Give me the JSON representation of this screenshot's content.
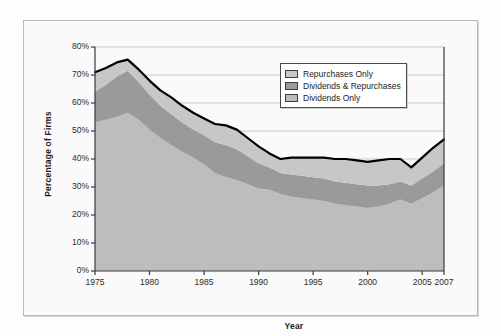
{
  "chart_data": {
    "type": "area",
    "stacked": true,
    "title": "",
    "xlabel": "Year",
    "ylabel": "Percentage of Firms",
    "xlim": [
      1975,
      2007
    ],
    "ylim": [
      0,
      80
    ],
    "y_tick_labels": [
      "0%",
      "10%",
      "20%",
      "30%",
      "40%",
      "50%",
      "60%",
      "70%",
      "80%"
    ],
    "y_ticks": [
      0,
      10,
      20,
      30,
      40,
      50,
      60,
      70,
      80
    ],
    "x_ticks": [
      1975,
      1980,
      1985,
      1990,
      1995,
      2000,
      2005,
      2007
    ],
    "x_tick_labels": [
      "1975",
      "1980",
      "1985",
      "1990",
      "1995",
      "2000",
      "2005",
      "2007"
    ],
    "grid": "horizontal",
    "legend_position": "top-right",
    "x": [
      1975,
      1976,
      1977,
      1978,
      1979,
      1980,
      1981,
      1982,
      1983,
      1984,
      1985,
      1986,
      1987,
      1988,
      1989,
      1990,
      1991,
      1992,
      1993,
      1994,
      1995,
      1996,
      1997,
      1998,
      1999,
      2000,
      2001,
      2002,
      2003,
      2004,
      2005,
      2006,
      2007
    ],
    "series": [
      {
        "name": "Dividends Only",
        "color": "#bdbdbd",
        "values": [
          53.0,
          54.0,
          55.0,
          56.5,
          54.0,
          50.5,
          47.5,
          45.0,
          42.5,
          40.5,
          38.0,
          35.0,
          33.5,
          32.5,
          31.0,
          29.5,
          29.0,
          27.5,
          26.5,
          26.0,
          25.5,
          25.0,
          24.0,
          23.5,
          23.0,
          22.5,
          23.0,
          24.0,
          25.5,
          24.0,
          26.0,
          28.0,
          30.5
        ]
      },
      {
        "name": "Dividends & Repurchases",
        "color": "#9a9a9a",
        "values": [
          11.0,
          12.5,
          14.5,
          15.0,
          13.5,
          12.5,
          11.5,
          11.0,
          10.5,
          10.0,
          10.5,
          11.0,
          11.5,
          11.0,
          10.0,
          9.0,
          8.0,
          7.5,
          8.0,
          8.0,
          8.0,
          8.0,
          8.0,
          8.0,
          8.0,
          8.0,
          7.5,
          7.0,
          6.5,
          6.5,
          7.0,
          7.5,
          8.0
        ]
      },
      {
        "name": "Repurchases Only",
        "color": "#c7c7c7",
        "values": [
          7.0,
          6.0,
          5.0,
          4.0,
          4.5,
          5.0,
          5.5,
          6.0,
          6.0,
          6.0,
          6.0,
          6.5,
          7.0,
          7.0,
          6.5,
          6.0,
          5.0,
          5.0,
          6.0,
          6.5,
          7.0,
          7.5,
          8.0,
          8.5,
          8.5,
          8.5,
          9.0,
          9.0,
          8.0,
          6.5,
          7.5,
          8.5,
          8.5
        ]
      }
    ],
    "total_line": {
      "name": "Total",
      "color": "#000000",
      "values": [
        71.0,
        72.5,
        74.5,
        75.5,
        72.0,
        68.0,
        64.5,
        62.0,
        59.0,
        56.5,
        54.5,
        52.5,
        52.0,
        50.5,
        47.5,
        44.5,
        42.0,
        40.0,
        40.5,
        40.5,
        40.5,
        40.5,
        40.0,
        40.0,
        39.5,
        39.0,
        39.5,
        40.0,
        40.0,
        37.0,
        40.5,
        44.0,
        47.0
      ]
    }
  },
  "legend": {
    "items": [
      {
        "label": "Repurchases Only",
        "color": "#c7c7c7"
      },
      {
        "label": "Dividends & Repurchases",
        "color": "#9a9a9a"
      },
      {
        "label": "Dividends Only",
        "color": "#bdbdbd"
      }
    ]
  },
  "colors": {
    "plot_background": "#fafafa",
    "grid": "#c9c9c9",
    "axis": "#3a3a3a",
    "frame_border": "#b9b9b9",
    "page_background": "#fdfdfd"
  }
}
